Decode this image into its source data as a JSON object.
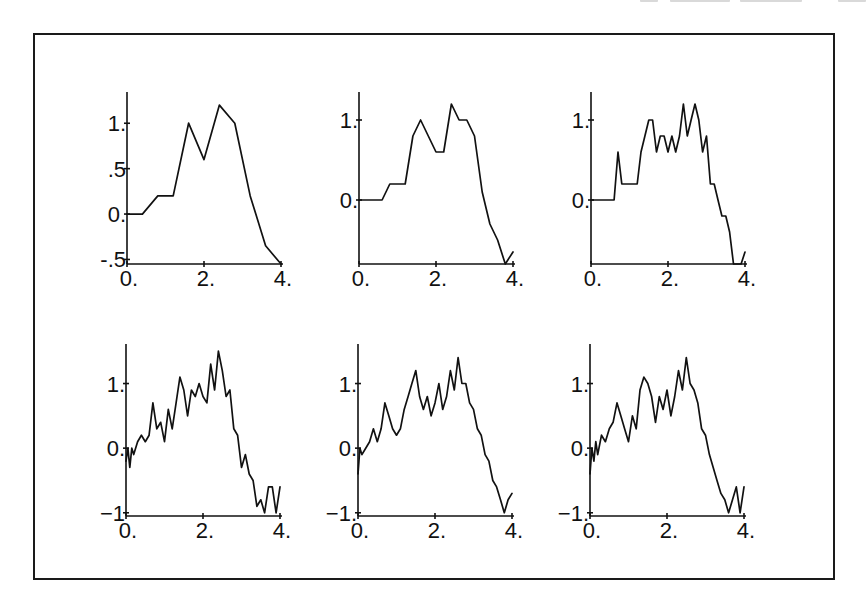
{
  "figure": {
    "layout": "2 rows x 3 columns of small line plots inside a bordered frame",
    "border_color": "#1a1a1a",
    "line_color": "#111111"
  },
  "chart_data": [
    {
      "type": "line",
      "panel": "row1-col1",
      "title": "",
      "xlabel": "",
      "ylabel": "",
      "xlim": [
        0,
        4
      ],
      "ylim": [
        -0.55,
        1.3
      ],
      "xticks": [
        0,
        2,
        4
      ],
      "xtick_labels": [
        "0.",
        "2.",
        "4."
      ],
      "yticks": [
        1,
        0.5,
        0,
        -0.5
      ],
      "ytick_labels": [
        "1.",
        ".5",
        "0.",
        "-.5"
      ],
      "grid": false,
      "series": [
        {
          "name": "path",
          "x": [
            0,
            0.4,
            0.8,
            1.2,
            1.6,
            2.0,
            2.4,
            2.8,
            3.2,
            3.6,
            4.0
          ],
          "y": [
            0,
            0,
            0.2,
            0.2,
            1.0,
            0.6,
            1.2,
            1.0,
            0.2,
            -0.35,
            -0.55
          ]
        }
      ]
    },
    {
      "type": "line",
      "panel": "row1-col2",
      "title": "",
      "xlabel": "",
      "ylabel": "",
      "xlim": [
        0,
        4
      ],
      "ylim": [
        -0.8,
        1.3
      ],
      "xticks": [
        0,
        2,
        4
      ],
      "xtick_labels": [
        "0.",
        "2.",
        "4."
      ],
      "yticks": [
        1,
        0
      ],
      "ytick_labels": [
        "1.",
        "0."
      ],
      "grid": false,
      "series": [
        {
          "name": "path",
          "x": [
            0,
            0.2,
            0.4,
            0.6,
            0.8,
            1.0,
            1.2,
            1.4,
            1.6,
            1.8,
            2.0,
            2.2,
            2.4,
            2.6,
            2.8,
            3.0,
            3.2,
            3.4,
            3.6,
            3.8,
            4.0
          ],
          "y": [
            0,
            0,
            0,
            0,
            0.2,
            0.2,
            0.2,
            0.8,
            1.0,
            0.8,
            0.6,
            0.6,
            1.2,
            1.0,
            1.0,
            0.8,
            0.1,
            -0.3,
            -0.5,
            -0.8,
            -0.65
          ]
        }
      ]
    },
    {
      "type": "line",
      "panel": "row1-col3",
      "title": "",
      "xlabel": "",
      "ylabel": "",
      "xlim": [
        0,
        4
      ],
      "ylim": [
        -0.8,
        1.3
      ],
      "xticks": [
        0,
        2,
        4
      ],
      "xtick_labels": [
        "0.",
        "2.",
        "4."
      ],
      "yticks": [
        1,
        0
      ],
      "ytick_labels": [
        "1.",
        "0."
      ],
      "grid": false,
      "series": [
        {
          "name": "path",
          "x": [
            0,
            0.1,
            0.2,
            0.3,
            0.4,
            0.5,
            0.6,
            0.7,
            0.8,
            0.9,
            1.0,
            1.1,
            1.2,
            1.3,
            1.4,
            1.5,
            1.6,
            1.7,
            1.8,
            1.9,
            2.0,
            2.1,
            2.2,
            2.3,
            2.4,
            2.5,
            2.6,
            2.7,
            2.8,
            2.9,
            3.0,
            3.1,
            3.2,
            3.3,
            3.4,
            3.5,
            3.6,
            3.7,
            3.8,
            3.9,
            4.0
          ],
          "y": [
            0,
            0,
            0,
            0,
            0,
            0,
            0,
            0.6,
            0.2,
            0.2,
            0.2,
            0.2,
            0.2,
            0.6,
            0.8,
            1.0,
            1.0,
            0.6,
            0.8,
            0.8,
            0.6,
            0.8,
            0.6,
            0.8,
            1.2,
            0.8,
            1.0,
            1.2,
            1.0,
            0.6,
            0.8,
            0.2,
            0.2,
            0.0,
            -0.2,
            -0.2,
            -0.4,
            -0.8,
            -0.8,
            -0.8,
            -0.65
          ]
        }
      ]
    },
    {
      "type": "line",
      "panel": "row2-col1",
      "title": "",
      "xlabel": "",
      "ylabel": "",
      "xlim": [
        0,
        4
      ],
      "ylim": [
        -1.05,
        1.55
      ],
      "xticks": [
        0,
        2,
        4
      ],
      "xtick_labels": [
        "0.",
        "2.",
        "4."
      ],
      "yticks": [
        1,
        0,
        -1
      ],
      "ytick_labels": [
        "1.",
        "0.",
        "−1"
      ],
      "grid": false,
      "series": [
        {
          "name": "path",
          "x": [
            0,
            0.05,
            0.1,
            0.15,
            0.2,
            0.3,
            0.4,
            0.5,
            0.6,
            0.7,
            0.8,
            0.9,
            1.0,
            1.1,
            1.2,
            1.3,
            1.4,
            1.5,
            1.6,
            1.7,
            1.8,
            1.9,
            2.0,
            2.1,
            2.2,
            2.3,
            2.4,
            2.5,
            2.6,
            2.7,
            2.8,
            2.9,
            3.0,
            3.1,
            3.2,
            3.3,
            3.4,
            3.5,
            3.6,
            3.7,
            3.8,
            3.9,
            4.0
          ],
          "y": [
            -0.2,
            0.0,
            -0.3,
            0.0,
            -0.1,
            0.1,
            0.2,
            0.1,
            0.2,
            0.7,
            0.3,
            0.4,
            0.1,
            0.6,
            0.3,
            0.7,
            1.1,
            0.9,
            0.5,
            0.9,
            0.8,
            1.0,
            0.8,
            0.7,
            1.3,
            0.9,
            1.5,
            1.2,
            0.8,
            0.9,
            0.3,
            0.2,
            -0.3,
            -0.1,
            -0.4,
            -0.5,
            -0.9,
            -0.8,
            -1.0,
            -0.6,
            -0.6,
            -1.0,
            -0.6
          ]
        }
      ]
    },
    {
      "type": "line",
      "panel": "row2-col2",
      "title": "",
      "xlabel": "",
      "ylabel": "",
      "xlim": [
        0,
        4
      ],
      "ylim": [
        -1.05,
        1.55
      ],
      "xticks": [
        0,
        2,
        4
      ],
      "xtick_labels": [
        "0.",
        "2.",
        "4."
      ],
      "yticks": [
        1,
        0,
        -1
      ],
      "ytick_labels": [
        "1.",
        "0.",
        "−1."
      ],
      "grid": false,
      "series": [
        {
          "name": "path",
          "x": [
            0,
            0.05,
            0.1,
            0.2,
            0.3,
            0.4,
            0.5,
            0.6,
            0.7,
            0.8,
            0.9,
            1.0,
            1.1,
            1.2,
            1.3,
            1.4,
            1.5,
            1.6,
            1.7,
            1.8,
            1.9,
            2.0,
            2.1,
            2.2,
            2.3,
            2.4,
            2.5,
            2.6,
            2.7,
            2.8,
            2.9,
            3.0,
            3.1,
            3.2,
            3.3,
            3.4,
            3.5,
            3.6,
            3.7,
            3.8,
            3.9,
            4.0
          ],
          "y": [
            -0.4,
            0.0,
            -0.1,
            0.0,
            0.1,
            0.3,
            0.1,
            0.3,
            0.7,
            0.5,
            0.3,
            0.2,
            0.3,
            0.6,
            0.8,
            1.0,
            1.2,
            0.8,
            0.6,
            0.8,
            0.5,
            0.7,
            1.0,
            0.6,
            0.8,
            1.2,
            0.9,
            1.4,
            1.0,
            1.0,
            0.7,
            0.6,
            0.3,
            0.2,
            -0.1,
            -0.2,
            -0.5,
            -0.6,
            -0.8,
            -1.0,
            -0.8,
            -0.7
          ]
        }
      ]
    },
    {
      "type": "line",
      "panel": "row2-col3",
      "title": "",
      "xlabel": "",
      "ylabel": "",
      "xlim": [
        0,
        4
      ],
      "ylim": [
        -1.05,
        1.55
      ],
      "xticks": [
        0,
        2,
        4
      ],
      "xtick_labels": [
        "0.",
        "2.",
        "4."
      ],
      "yticks": [
        1,
        0,
        -1
      ],
      "ytick_labels": [
        "1.",
        "0.",
        "−1."
      ],
      "grid": false,
      "series": [
        {
          "name": "path",
          "x": [
            0,
            0.05,
            0.1,
            0.15,
            0.2,
            0.3,
            0.4,
            0.5,
            0.6,
            0.7,
            0.8,
            0.9,
            1.0,
            1.1,
            1.2,
            1.3,
            1.4,
            1.5,
            1.6,
            1.7,
            1.8,
            1.9,
            2.0,
            2.1,
            2.2,
            2.3,
            2.4,
            2.5,
            2.6,
            2.7,
            2.8,
            2.9,
            3.0,
            3.1,
            3.2,
            3.3,
            3.4,
            3.5,
            3.6,
            3.7,
            3.8,
            3.9,
            4.0
          ],
          "y": [
            -0.4,
            0.0,
            -0.2,
            0.1,
            -0.1,
            0.2,
            0.1,
            0.3,
            0.4,
            0.7,
            0.5,
            0.3,
            0.1,
            0.5,
            0.3,
            0.9,
            1.1,
            1.0,
            0.8,
            0.4,
            0.8,
            0.6,
            0.9,
            0.5,
            0.8,
            1.2,
            0.9,
            1.4,
            1.0,
            0.9,
            0.7,
            0.3,
            0.2,
            -0.1,
            -0.3,
            -0.5,
            -0.7,
            -0.8,
            -1.0,
            -0.8,
            -0.6,
            -1.0,
            -0.6
          ]
        }
      ]
    }
  ]
}
